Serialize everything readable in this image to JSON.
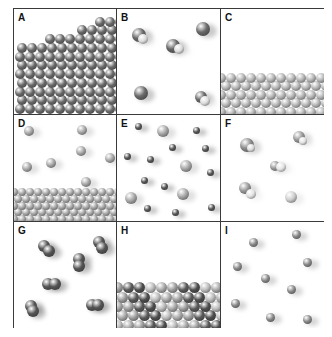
{
  "figure": {
    "type": "3x3 particle-model diagram",
    "panels": [
      {
        "id": "A",
        "label": "A",
        "kind": "solid-lattice",
        "atom_color": "#6a6a6a",
        "x": 0,
        "y": 0,
        "w": 103,
        "h": 106
      },
      {
        "id": "B",
        "label": "B",
        "kind": "gas-molecules",
        "x": 103,
        "y": 0,
        "w": 104,
        "h": 106,
        "atoms": [
          {
            "x": 22,
            "y": 26,
            "r": 7,
            "c": "#6a6a6a"
          },
          {
            "x": 26,
            "y": 30,
            "r": 5,
            "c": "#dcdcdc"
          },
          {
            "x": 56,
            "y": 37,
            "r": 7,
            "c": "#666"
          },
          {
            "x": 62,
            "y": 40,
            "r": 5,
            "c": "#dedede"
          },
          {
            "x": 86,
            "y": 20,
            "r": 7,
            "c": "#6a6a6a"
          },
          {
            "x": 24,
            "y": 84,
            "r": 7,
            "c": "#6a6a6a"
          },
          {
            "x": 84,
            "y": 88,
            "r": 6,
            "c": "#6a6a6a"
          },
          {
            "x": 88,
            "y": 92,
            "r": 5,
            "c": "#dedede"
          }
        ]
      },
      {
        "id": "C",
        "label": "C",
        "kind": "solid-layer-light",
        "atom_color": "#b5b5b5",
        "layer_top": 68,
        "x": 207,
        "y": 0,
        "w": 104,
        "h": 106
      },
      {
        "id": "D",
        "label": "D",
        "kind": "liquid-with-vapor",
        "atom_color": "#a8a8a8",
        "layer_top": 76,
        "x": 0,
        "y": 106,
        "w": 103,
        "h": 107,
        "atoms": [
          {
            "x": 15,
            "y": 16,
            "r": 5
          },
          {
            "x": 68,
            "y": 15,
            "r": 5
          },
          {
            "x": 67,
            "y": 36,
            "r": 5
          },
          {
            "x": 96,
            "y": 43,
            "r": 5
          },
          {
            "x": 37,
            "y": 48,
            "r": 5
          },
          {
            "x": 13,
            "y": 52,
            "r": 5
          },
          {
            "x": 72,
            "y": 67,
            "r": 5
          }
        ]
      },
      {
        "id": "E",
        "label": "E",
        "kind": "gas-mixture",
        "x": 103,
        "y": 106,
        "w": 104,
        "h": 107,
        "atoms": [
          {
            "x": 21,
            "y": 11,
            "r": 3.5,
            "c": "#555"
          },
          {
            "x": 46,
            "y": 16,
            "r": 6,
            "c": "#a8a8a8"
          },
          {
            "x": 79,
            "y": 15,
            "r": 3.5,
            "c": "#555"
          },
          {
            "x": 55,
            "y": 32,
            "r": 3.5,
            "c": "#555"
          },
          {
            "x": 88,
            "y": 33,
            "r": 3.5,
            "c": "#555"
          },
          {
            "x": 10,
            "y": 41,
            "r": 3.5,
            "c": "#555"
          },
          {
            "x": 33,
            "y": 44,
            "r": 3.5,
            "c": "#555"
          },
          {
            "x": 69,
            "y": 51,
            "r": 6,
            "c": "#a8a8a8"
          },
          {
            "x": 93,
            "y": 57,
            "r": 3.5,
            "c": "#555"
          },
          {
            "x": 27,
            "y": 65,
            "r": 3.5,
            "c": "#555"
          },
          {
            "x": 47,
            "y": 71,
            "r": 3.5,
            "c": "#555"
          },
          {
            "x": 66,
            "y": 79,
            "r": 6,
            "c": "#a8a8a8"
          },
          {
            "x": 14,
            "y": 83,
            "r": 6,
            "c": "#a8a8a8"
          },
          {
            "x": 30,
            "y": 93,
            "r": 3.5,
            "c": "#555"
          },
          {
            "x": 58,
            "y": 97,
            "r": 3.5,
            "c": "#555"
          },
          {
            "x": 94,
            "y": 92,
            "r": 3.5,
            "c": "#555"
          }
        ]
      },
      {
        "id": "F",
        "label": "F",
        "kind": "gas-molecules-light",
        "x": 207,
        "y": 106,
        "w": 104,
        "h": 107,
        "atoms": [
          {
            "x": 26,
            "y": 30,
            "r": 7,
            "c": "#8c8c8c"
          },
          {
            "x": 30,
            "y": 33,
            "r": 4,
            "c": "#dcdcdc"
          },
          {
            "x": 78,
            "y": 22,
            "r": 6,
            "c": "#9a9a9a"
          },
          {
            "x": 82,
            "y": 26,
            "r": 4,
            "c": "#e2e2e2"
          },
          {
            "x": 54,
            "y": 51,
            "r": 5,
            "c": "#9a9a9a"
          },
          {
            "x": 60,
            "y": 52,
            "r": 5,
            "c": "#e4e4e4"
          },
          {
            "x": 24,
            "y": 73,
            "r": 6,
            "c": "#9a9a9a"
          },
          {
            "x": 30,
            "y": 79,
            "r": 5,
            "c": "#e2e2e2"
          },
          {
            "x": 70,
            "y": 82,
            "r": 6,
            "c": "#cfcfcf"
          }
        ]
      },
      {
        "id": "G",
        "label": "G",
        "kind": "diatomic-gas",
        "x": 0,
        "y": 213,
        "w": 103,
        "h": 107,
        "atoms": [
          {
            "x": 30,
            "y": 24,
            "r": 6,
            "c": "#555"
          },
          {
            "x": 35,
            "y": 29,
            "r": 6,
            "c": "#555"
          },
          {
            "x": 85,
            "y": 20,
            "r": 6,
            "c": "#555"
          },
          {
            "x": 88,
            "y": 26,
            "r": 6,
            "c": "#555"
          },
          {
            "x": 65,
            "y": 37,
            "r": 6,
            "c": "#555"
          },
          {
            "x": 65,
            "y": 44,
            "r": 6,
            "c": "#555"
          },
          {
            "x": 34,
            "y": 62,
            "r": 6,
            "c": "#555"
          },
          {
            "x": 41,
            "y": 62,
            "r": 6,
            "c": "#555"
          },
          {
            "x": 17,
            "y": 84,
            "r": 6,
            "c": "#555"
          },
          {
            "x": 19,
            "y": 89,
            "r": 6,
            "c": "#555"
          },
          {
            "x": 78,
            "y": 83,
            "r": 6,
            "c": "#555"
          },
          {
            "x": 84,
            "y": 83,
            "r": 6,
            "c": "#555"
          }
        ]
      },
      {
        "id": "H",
        "label": "H",
        "kind": "solid-mixture",
        "layer_top": 60,
        "x": 103,
        "y": 213,
        "w": 104,
        "h": 107
      },
      {
        "id": "I",
        "label": "I",
        "kind": "monatomic-gas",
        "x": 207,
        "y": 213,
        "w": 104,
        "h": 107,
        "atoms": [
          {
            "x": 75,
            "y": 12,
            "r": 4.5
          },
          {
            "x": 32,
            "y": 20,
            "r": 4.5
          },
          {
            "x": 16,
            "y": 44,
            "r": 4.5
          },
          {
            "x": 86,
            "y": 40,
            "r": 4.5
          },
          {
            "x": 44,
            "y": 56,
            "r": 4.5
          },
          {
            "x": 70,
            "y": 67,
            "r": 4.5
          },
          {
            "x": 14,
            "y": 81,
            "r": 4.5
          },
          {
            "x": 49,
            "y": 95,
            "r": 4.5
          },
          {
            "x": 86,
            "y": 97,
            "r": 4.5
          }
        ]
      }
    ]
  }
}
